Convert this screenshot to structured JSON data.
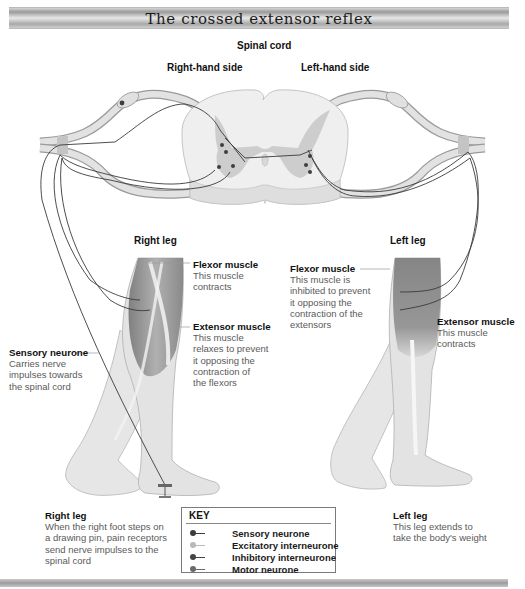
{
  "title": "The crossed extensor reflex",
  "headings": {
    "spinal_cord": "Spinal cord",
    "right_hand_side": "Right-hand side",
    "left_hand_side": "Left-hand side",
    "right_leg_top": "Right leg",
    "left_leg_top": "Left leg"
  },
  "annotations": {
    "right_flexor": {
      "title": "Flexor muscle",
      "lines": [
        "This muscle",
        "contracts"
      ]
    },
    "right_extensor": {
      "title": "Extensor muscle",
      "lines": [
        "This muscle",
        "relaxes to prevent",
        "it opposing the",
        "contraction of",
        "the flexors"
      ]
    },
    "sensory_neurone": {
      "title": "Sensory neurone",
      "lines": [
        "Carries nerve",
        "impulses towards",
        "the spinal cord"
      ]
    },
    "left_flexor": {
      "title": "Flexor muscle",
      "lines": [
        "This muscle is",
        "inhibited to prevent",
        "it opposing the",
        "contraction of the",
        "extensors"
      ]
    },
    "left_extensor": {
      "title": "Extensor muscle",
      "lines": [
        "This muscle",
        "contracts"
      ]
    },
    "right_leg_bottom": {
      "title": "Right leg",
      "lines": [
        "When the right foot steps on",
        "a drawing pin, pain receptors",
        "send nerve impulses to the",
        "spinal cord"
      ]
    },
    "left_leg_bottom": {
      "title": "Left leg",
      "lines": [
        "This leg extends to",
        "take the body's weight"
      ]
    }
  },
  "key": {
    "title": "KEY",
    "items": [
      {
        "label": "Sensory neurone",
        "color": "#3c3c3c",
        "icon": "sensory-neurone-symbol"
      },
      {
        "label": "Excitatory interneurone",
        "color": "#b9b9b9",
        "icon": "excitatory-interneurone-symbol"
      },
      {
        "label": "Inhibitory interneurone",
        "color": "#444444",
        "icon": "inhibitory-interneurone-symbol"
      },
      {
        "label": "Motor neurone",
        "color": "#6a6a6a",
        "icon": "motor-neurone-symbol"
      }
    ]
  },
  "colors": {
    "nerve": "#d9d9d9",
    "nerve_edge": "#8e8e8e",
    "cord": "#ececec",
    "grey_matter": "#c6c6c6",
    "muscle": "#8a8a8a",
    "skin": "#e4e4e4",
    "neurone_line": "#3a3a3a"
  }
}
